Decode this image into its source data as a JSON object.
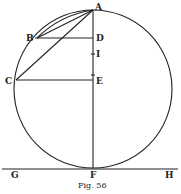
{
  "figure": {
    "caption": "Fig. 56",
    "labels": {
      "A": "A",
      "B": "B",
      "C": "C",
      "D": "D",
      "E": "E",
      "F": "F",
      "G": "G",
      "H": "H",
      "I": "I"
    },
    "stroke_color": "#222222",
    "background": "#ffffff"
  }
}
